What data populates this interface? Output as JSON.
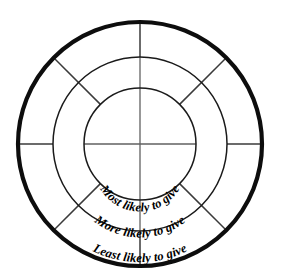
{
  "diagram": {
    "type": "concentric-ring-wheel",
    "background_color": "#ffffff",
    "center": {
      "x": 140,
      "y": 144
    },
    "rings": [
      {
        "id": "inner",
        "name": "inner-ring",
        "label": "Most likely to give",
        "radius": 56,
        "stroke_color": "#1a1a1a",
        "stroke_width": 1.5,
        "label_radius": 46
      },
      {
        "id": "middle",
        "name": "middle-ring",
        "label": "More likely to give",
        "radius": 87,
        "stroke_color": "#1a1a1a",
        "stroke_width": 1.5,
        "label_radius": 74
      },
      {
        "id": "outer",
        "name": "outer-ring",
        "label": "Least likely to give",
        "radius": 122,
        "stroke_color": "#0d0d0d",
        "stroke_width": 4.2,
        "label_radius": 106
      }
    ],
    "spokes": {
      "color": "#555555",
      "vertical_top": true,
      "vertical_bottom": true,
      "horizontal_left": true,
      "horizontal_right": true,
      "diagonals_degrees": [
        45,
        135,
        225,
        315
      ]
    },
    "labels": {
      "inner": "Most likely to give",
      "middle": "More likely to give",
      "outer": "Least likely to give"
    }
  }
}
